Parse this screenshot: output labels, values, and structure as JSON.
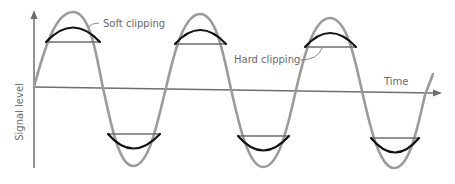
{
  "diagram": {
    "labels": {
      "soft_clipping": "Soft clipping",
      "hard_clipping": "Hard clipping",
      "x_axis": "Time",
      "y_axis": "Signal level"
    },
    "colors": {
      "sine_wave": "#9b9b9b",
      "soft_clip_curve": "#111111",
      "hard_clip_line": "#6e6e6e",
      "axis": "#6e6e6e",
      "label_text": "#6a6a6a"
    },
    "wave": {
      "cycles_shown": 3,
      "peaks_x": [
        73,
        200,
        330
      ],
      "troughs_x": [
        133,
        263,
        394
      ]
    }
  }
}
